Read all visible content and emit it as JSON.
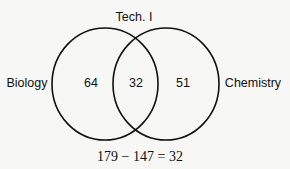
{
  "diagram": {
    "type": "venn",
    "top_label": "Tech. I",
    "sets": [
      {
        "name": "Biology",
        "only_count": "64"
      },
      {
        "name": "Chemistry",
        "only_count": "51"
      }
    ],
    "intersection_count": "32",
    "equation": "179 − 147 = 32"
  },
  "colors": {
    "stroke": "#111111",
    "background": "#f7f7f5"
  }
}
